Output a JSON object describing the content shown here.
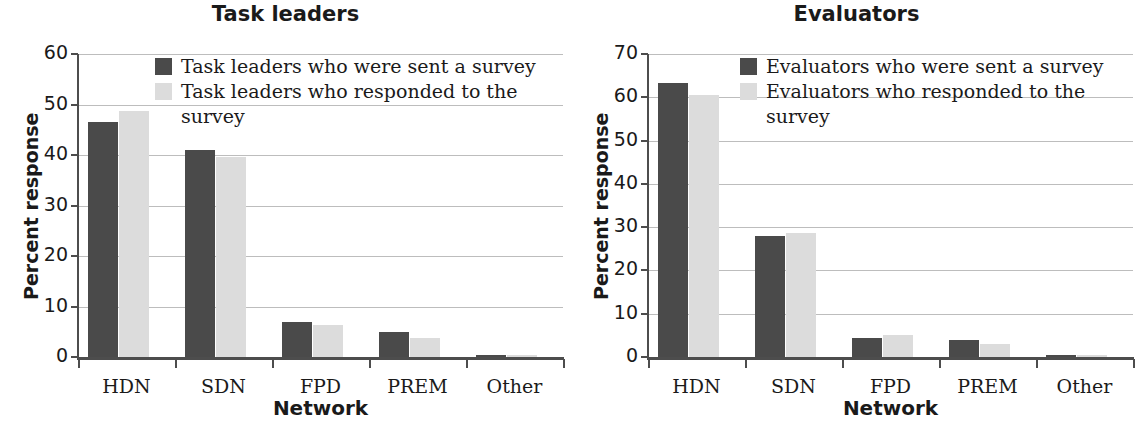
{
  "figure": {
    "width": 1143,
    "height": 433,
    "background": "#ffffff"
  },
  "colors": {
    "series_sent": "#4a4a4a",
    "series_responded": "#dcdcdc",
    "axis": "#4d4d4d",
    "grid": "#bdbdbd",
    "text": "#1a1a1a"
  },
  "panels": [
    {
      "id": "task-leaders",
      "title": "Task leaders",
      "ylabel": "Percent response",
      "xlabel": "Network",
      "yticks": [
        "60",
        "50",
        "40",
        "30",
        "20",
        "10",
        "0"
      ],
      "xticks": [
        "HDN",
        "SDN",
        "FPD",
        "PREM",
        "Other"
      ],
      "legend": [
        {
          "label": "Task leaders who were sent a survey",
          "color": "#4a4a4a"
        },
        {
          "label": "Task leaders who responded to the survey",
          "color": "#dcdcdc"
        }
      ]
    },
    {
      "id": "evaluators",
      "title": "Evaluators",
      "ylabel": "Percent response",
      "xlabel": "Network",
      "yticks": [
        "70",
        "60",
        "50",
        "40",
        "30",
        "20",
        "10",
        "0"
      ],
      "xticks": [
        "HDN",
        "SDN",
        "FPD",
        "PREM",
        "Other"
      ],
      "legend": [
        {
          "label": "Evaluators who were sent a survey",
          "color": "#4a4a4a"
        },
        {
          "label": "Evaluators who responded to the survey",
          "color": "#dcdcdc"
        }
      ]
    }
  ],
  "chart_data": [
    {
      "type": "bar",
      "title": "Task leaders",
      "xlabel": "Network",
      "ylabel": "Percent response",
      "categories": [
        "HDN",
        "SDN",
        "FPD",
        "PREM",
        "Other"
      ],
      "series": [
        {
          "name": "Task leaders who were sent a survey",
          "color": "#4a4a4a",
          "values": [
            46.5,
            41.0,
            7.0,
            5.0,
            0.2
          ]
        },
        {
          "name": "Task leaders who responded to the survey",
          "color": "#dcdcdc",
          "values": [
            48.8,
            39.7,
            6.4,
            3.7,
            0.2
          ]
        }
      ],
      "ylim": [
        0,
        60
      ],
      "ytick_step": 10,
      "grid": true,
      "legend_position": "top-center"
    },
    {
      "type": "bar",
      "title": "Evaluators",
      "xlabel": "Network",
      "ylabel": "Percent response",
      "categories": [
        "HDN",
        "SDN",
        "FPD",
        "PREM",
        "Other"
      ],
      "series": [
        {
          "name": "Evaluators who were sent a survey",
          "color": "#4a4a4a",
          "values": [
            63.3,
            28.0,
            4.5,
            4.0,
            0.2
          ]
        },
        {
          "name": "Evaluators who responded to the survey",
          "color": "#dcdcdc",
          "values": [
            60.5,
            28.7,
            5.1,
            3.1,
            0.2
          ]
        }
      ],
      "ylim": [
        0,
        70
      ],
      "ytick_step": 10,
      "grid": true,
      "legend_position": "top-center"
    }
  ]
}
